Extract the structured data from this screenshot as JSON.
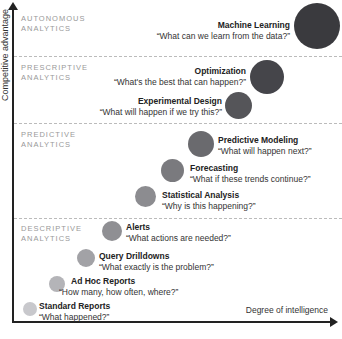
{
  "axes": {
    "y_label": "Competitive advantage",
    "x_label": "Degree of intelligence"
  },
  "zones": [
    {
      "line1": "AUTONOMOUS",
      "line2": "ANALYTICS"
    },
    {
      "line1": "PRESCRIPTIVE",
      "line2": "ANALYTICS"
    },
    {
      "line1": "PREDICTIVE",
      "line2": "ANALYTICS"
    },
    {
      "line1": "DESCRIPTIVE",
      "line2": "ANALYTICS"
    }
  ],
  "stages": [
    {
      "title": "Machine Learning",
      "question": "“What can we learn from the data?”",
      "color": "#3a3a3e"
    },
    {
      "title": "Optimization",
      "question": "“What's the best that can happen?”",
      "color": "#45454a"
    },
    {
      "title": "Experimental Design",
      "question": "“What will happen if we try this?”",
      "color": "#555559"
    },
    {
      "title": "Predictive Modeling",
      "question": "“What will happen next?”",
      "color": "#6a6a6e"
    },
    {
      "title": "Forecasting",
      "question": "“What if these trends continue?”",
      "color": "#7a7a7e"
    },
    {
      "title": "Statistical Analysis",
      "question": "“Why is this happening?”",
      "color": "#8c8c90"
    },
    {
      "title": "Alerts",
      "question": "“What actions are needed?”",
      "color": "#8f8f93"
    },
    {
      "title": "Query Drilldowns",
      "question": "“What exactly is the problem?”",
      "color": "#a2a2a6"
    },
    {
      "title": "Ad Hoc Reports",
      "question": "“How many, how often, where?”",
      "color": "#b4b4b8"
    },
    {
      "title": "Standard Reports",
      "question": "“What happened?”",
      "color": "#c8c8cc"
    }
  ]
}
